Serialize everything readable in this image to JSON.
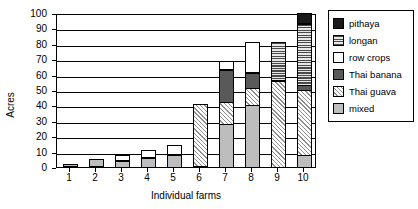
{
  "chart_data": {
    "type": "bar",
    "subtype": "stacked-bar",
    "title": "",
    "xlabel": "Individual farms",
    "ylabel": "Acres",
    "ylim": [
      0,
      100
    ],
    "ytick_step": 10,
    "yticks": [
      0,
      10,
      20,
      30,
      40,
      50,
      60,
      70,
      80,
      90,
      100
    ],
    "categories": [
      "1",
      "2",
      "3",
      "4",
      "5",
      "6",
      "7",
      "8",
      "9",
      "10"
    ],
    "grid": "horizontal",
    "legend_position": "right",
    "series": [
      {
        "name": "pithaya",
        "color": "#1a1a1a",
        "pattern": "solid-black",
        "values": [
          0,
          0,
          0,
          0,
          0,
          0,
          0,
          0,
          0,
          7
        ]
      },
      {
        "name": "longan",
        "color": "#e8e8e8",
        "pattern": "horizontal-lines",
        "values": [
          0,
          0,
          0,
          0,
          0,
          0,
          0,
          0,
          25,
          40
        ]
      },
      {
        "name": "row crops",
        "color": "#ffffff",
        "pattern": "blank",
        "values": [
          0,
          0,
          4,
          5,
          6,
          0,
          6,
          20,
          0,
          0
        ]
      },
      {
        "name": "Thai banana",
        "color": "#595959",
        "pattern": "solid-dark-gray",
        "values": [
          0,
          0,
          0,
          0,
          0,
          0,
          21,
          10,
          0,
          3
        ]
      },
      {
        "name": "Thai guava",
        "color": "#f2f2f2",
        "pattern": "diagonal-hatch",
        "values": [
          0,
          0,
          0,
          0,
          0,
          41,
          14,
          11,
          56,
          42
        ]
      },
      {
        "name": "mixed",
        "color": "#bdbdbd",
        "pattern": "solid-light-gray",
        "values": [
          2,
          5,
          4,
          6,
          8,
          0,
          28,
          40,
          0,
          8
        ]
      }
    ],
    "totals": [
      2,
      5,
      8,
      11,
      14,
      41,
      69,
      81,
      81,
      100
    ]
  },
  "legend": {
    "items": [
      {
        "label": "pithaya"
      },
      {
        "label": "longan"
      },
      {
        "label": "row crops"
      },
      {
        "label": "Thai banana"
      },
      {
        "label": "Thai guava"
      },
      {
        "label": "mixed"
      }
    ]
  }
}
